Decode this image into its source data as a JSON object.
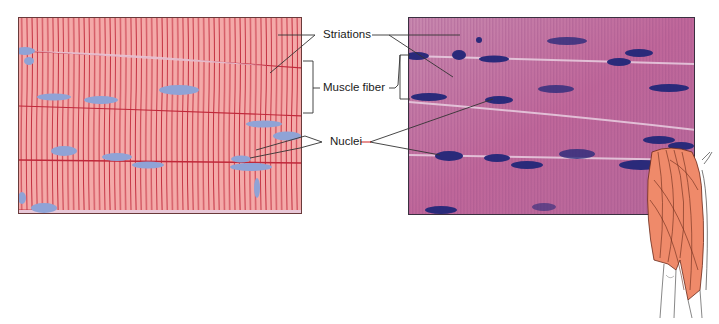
{
  "figure": {
    "labels": {
      "striations": "Striations",
      "muscle_fiber": "Muscle fiber",
      "nuclei": "Nuclei"
    },
    "panels": {
      "left": {
        "type": "illustration",
        "subject": "skeletal muscle fibers drawing"
      },
      "right": {
        "type": "micrograph",
        "subject": "skeletal muscle tissue light micrograph"
      }
    },
    "inset": {
      "subject": "thigh muscle illustration"
    },
    "colors": {
      "drawing_fill": "#f4a9a8",
      "striation_line": "#c0283a",
      "nucleus_drawing": "#8fa3d6",
      "micrograph_base": "#c56a9a",
      "micrograph_nucleus": "#2a2a7a",
      "muscle_inset": "#ef8a6a",
      "leader_red": "#d02020"
    }
  }
}
